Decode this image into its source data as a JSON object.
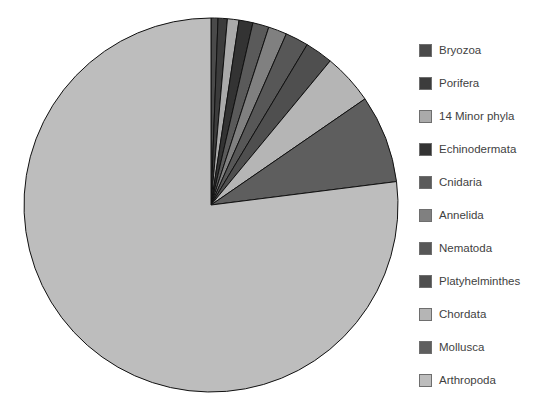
{
  "background_color": "#ffffff",
  "chart_data": {
    "type": "pie",
    "title": "",
    "subtitle": "",
    "xlabel": "",
    "ylabel": "",
    "legend_position": "right",
    "grid": false,
    "start_angle_deg": 0,
    "direction": "clockwise",
    "center": {
      "x": 211,
      "y": 205
    },
    "radius": 187,
    "stroke_color": "#111111",
    "stroke_width": 1,
    "categories": [
      "Bryozoa",
      "Porifera",
      "14 Minor phyla",
      "Echinodermata",
      "Cnidaria",
      "Annelida",
      "Nematoda",
      "Platyhelminthes",
      "Chordata",
      "Mollusca",
      "Arthropoda"
    ],
    "values": [
      0.6,
      0.8,
      1.0,
      1.2,
      1.4,
      1.6,
      2.0,
      2.4,
      4.4,
      7.6,
      77.0
    ],
    "unit": "percent",
    "colors": [
      "#4a4a4a",
      "#3c3c3c",
      "#aaaaaa",
      "#333333",
      "#5a5a5a",
      "#808080",
      "#575757",
      "#4f4f4f",
      "#b5b5b5",
      "#5e5e5e",
      "#bdbdbd"
    ],
    "slices": [
      {
        "label": "Bryozoa",
        "value": 0.6,
        "color": "#4a4a4a"
      },
      {
        "label": "Porifera",
        "value": 0.8,
        "color": "#3c3c3c"
      },
      {
        "label": "14 Minor phyla",
        "value": 1.0,
        "color": "#aaaaaa"
      },
      {
        "label": "Echinodermata",
        "value": 1.2,
        "color": "#333333"
      },
      {
        "label": "Cnidaria",
        "value": 1.4,
        "color": "#5a5a5a"
      },
      {
        "label": "Annelida",
        "value": 1.6,
        "color": "#808080"
      },
      {
        "label": "Nematoda",
        "value": 2.0,
        "color": "#575757"
      },
      {
        "label": "Platyhelminthes",
        "value": 2.4,
        "color": "#4f4f4f"
      },
      {
        "label": "Chordata",
        "value": 4.4,
        "color": "#b5b5b5"
      },
      {
        "label": "Mollusca",
        "value": 7.6,
        "color": "#5e5e5e"
      },
      {
        "label": "Arthropoda",
        "value": 77.0,
        "color": "#bdbdbd"
      }
    ]
  },
  "legend": {
    "items": [
      {
        "label": "Bryozoa",
        "color": "#4a4a4a"
      },
      {
        "label": "Porifera",
        "color": "#3c3c3c"
      },
      {
        "label": "14 Minor phyla",
        "color": "#aaaaaa"
      },
      {
        "label": "Echinodermata",
        "color": "#333333"
      },
      {
        "label": "Cnidaria",
        "color": "#5a5a5a"
      },
      {
        "label": "Annelida",
        "color": "#808080"
      },
      {
        "label": "Nematoda",
        "color": "#575757"
      },
      {
        "label": "Platyhelminthes",
        "color": "#4f4f4f"
      },
      {
        "label": "Chordata",
        "color": "#b5b5b5"
      },
      {
        "label": "Mollusca",
        "color": "#5e5e5e"
      },
      {
        "label": "Arthropoda",
        "color": "#bdbdbd"
      }
    ]
  }
}
